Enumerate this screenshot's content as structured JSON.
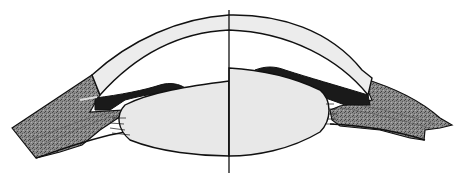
{
  "diagram": {
    "type": "anatomical-cross-section",
    "structures": [
      {
        "id": "cornea",
        "label": "cornea"
      },
      {
        "id": "lens",
        "label": "lens"
      },
      {
        "id": "iris",
        "label": "iris"
      },
      {
        "id": "ciliary-body",
        "label": "ciliary body"
      },
      {
        "id": "sclera",
        "label": "sclera"
      },
      {
        "id": "zonules",
        "label": "zonular fibers"
      },
      {
        "id": "optical-axis",
        "label": "optical axis"
      }
    ],
    "colors": {
      "background": "#ffffff",
      "outline": "#111111",
      "cornea_fill": "#ececec",
      "lens_fill": "#e8e8e8",
      "tissue_fill": "#7a7a7a",
      "iris_fill": "#1a1a1a"
    },
    "text_labels": []
  }
}
